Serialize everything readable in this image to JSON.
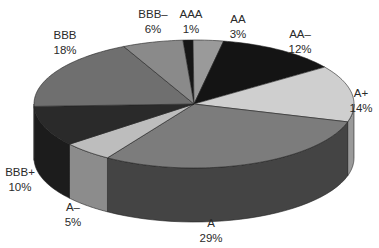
{
  "chart_data": {
    "type": "pie",
    "style": "3d",
    "title": "",
    "categories": [
      "AAA",
      "AA",
      "AA–",
      "A+",
      "A",
      "A–",
      "BBB+",
      "BBB",
      "BBB–"
    ],
    "values": [
      1,
      3,
      12,
      14,
      29,
      5,
      10,
      18,
      6
    ],
    "unit": "%",
    "colors": [
      "#161616",
      "#9a9a9a",
      "#141414",
      "#cfcfcf",
      "#7c7c7c",
      "#bdbdbd",
      "#2a2a2a",
      "#6f6f6f",
      "#8a8a8a"
    ],
    "side_colors": [
      "#111111",
      "#6a6a6a",
      "#0f0f0f",
      "#9a9a9a",
      "#444444",
      "#8c8c8c",
      "#1c1c1c",
      "#4a4a4a",
      "#5a5a5a"
    ],
    "start_angle_deg": -94,
    "direction": "clockwise",
    "legend": "none",
    "labels": [
      {
        "name": "AAA",
        "pct": "1%",
        "x": 191,
        "y": 7
      },
      {
        "name": "AA",
        "pct": "3%",
        "x": 238,
        "y": 12
      },
      {
        "name": "AA–",
        "pct": "12%",
        "x": 300,
        "y": 27
      },
      {
        "name": "A+",
        "pct": "14%",
        "x": 361,
        "y": 86
      },
      {
        "name": "A",
        "pct": "29%",
        "x": 211,
        "y": 216
      },
      {
        "name": "A–",
        "pct": "5%",
        "x": 73,
        "y": 200
      },
      {
        "name": "BBB+",
        "pct": "10%",
        "x": 20,
        "y": 165
      },
      {
        "name": "BBB",
        "pct": "18%",
        "x": 65,
        "y": 28
      },
      {
        "name": "BBB–",
        "pct": "6%",
        "x": 153,
        "y": 7
      }
    ]
  },
  "geometry": {
    "cx": 194,
    "cy": 104,
    "rx": 160,
    "ry": 64,
    "depth": 54
  }
}
